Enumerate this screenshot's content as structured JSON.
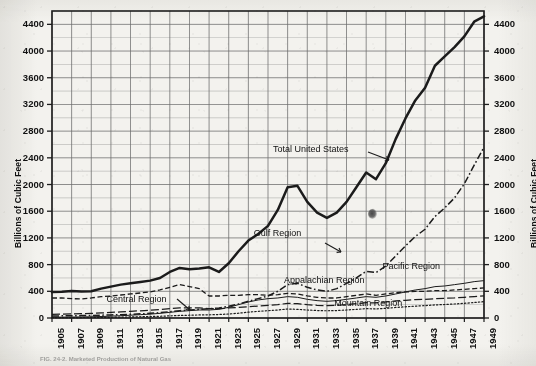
{
  "figure": {
    "caption": "FIG. 24-2.   Marketed Production of Natural Gas",
    "background_color": "#f3f2ee",
    "ink_color": "#1a1a1a"
  },
  "chart_data": {
    "type": "line",
    "title": "",
    "xlabel": "",
    "ylabel": "Billions of Cubic Feet",
    "ylabel_right": "Billions of Cubic Feet",
    "xlim": [
      1905,
      1949
    ],
    "ylim": [
      0,
      4600
    ],
    "yticks": [
      0,
      400,
      800,
      1200,
      1600,
      2000,
      2400,
      2800,
      3200,
      3600,
      4000,
      4400
    ],
    "xticks": [
      1905,
      1907,
      1909,
      1911,
      1913,
      1915,
      1917,
      1919,
      1921,
      1923,
      1925,
      1927,
      1929,
      1931,
      1933,
      1935,
      1937,
      1939,
      1941,
      1943,
      1945,
      1947,
      1949
    ],
    "grid": true,
    "grid_color": "#6d6d6d",
    "legend_position": "inline-annotations",
    "x": [
      1905,
      1906,
      1907,
      1908,
      1909,
      1910,
      1911,
      1912,
      1913,
      1914,
      1915,
      1916,
      1917,
      1918,
      1919,
      1920,
      1921,
      1922,
      1923,
      1924,
      1925,
      1926,
      1927,
      1928,
      1929,
      1930,
      1931,
      1932,
      1933,
      1934,
      1935,
      1936,
      1937,
      1938,
      1939,
      1940,
      1941,
      1942,
      1943,
      1944,
      1945,
      1946,
      1947,
      1948,
      1949
    ],
    "series": [
      {
        "name": "Total United States",
        "style": "solid-heavy",
        "label_x": 1932,
        "label_y": 2520,
        "values": [
          388,
          392,
          405,
          398,
          400,
          440,
          470,
          500,
          520,
          540,
          560,
          600,
          690,
          750,
          730,
          740,
          760,
          690,
          820,
          1000,
          1160,
          1260,
          1380,
          1620,
          1960,
          1980,
          1740,
          1580,
          1500,
          1580,
          1740,
          1960,
          2180,
          2080,
          2320,
          2680,
          2990,
          3260,
          3450,
          3780,
          3920,
          4060,
          4220,
          4440,
          4520
        ]
      },
      {
        "name": "Gulf Region",
        "style": "dash-dot",
        "label_x": 1929,
        "label_y": 1260,
        "values": [
          30,
          32,
          34,
          36,
          38,
          42,
          46,
          50,
          56,
          62,
          70,
          80,
          95,
          110,
          120,
          130,
          140,
          150,
          175,
          210,
          250,
          290,
          330,
          400,
          500,
          520,
          460,
          420,
          400,
          440,
          520,
          600,
          700,
          680,
          780,
          930,
          1080,
          1220,
          1330,
          1520,
          1650,
          1800,
          2010,
          2290,
          2560
        ]
      },
      {
        "name": "Central Region",
        "style": "dashed",
        "label_x": 1913,
        "label_y": 270,
        "values": [
          300,
          300,
          290,
          285,
          300,
          320,
          330,
          345,
          360,
          375,
          390,
          420,
          460,
          500,
          470,
          440,
          330,
          330,
          340,
          340,
          350,
          350,
          340,
          350,
          370,
          360,
          330,
          310,
          300,
          300,
          320,
          340,
          360,
          340,
          360,
          380,
          390,
          400,
          400,
          410,
          410,
          420,
          430,
          440,
          450
        ]
      },
      {
        "name": "Appalachian Region",
        "style": "dash-long",
        "label_x": 1935,
        "label_y": 560,
        "values": [
          55,
          58,
          62,
          66,
          70,
          76,
          84,
          92,
          100,
          108,
          116,
          126,
          140,
          150,
          150,
          150,
          140,
          140,
          150,
          160,
          170,
          180,
          190,
          200,
          220,
          215,
          200,
          190,
          185,
          190,
          200,
          215,
          230,
          225,
          240,
          255,
          265,
          275,
          280,
          290,
          295,
          300,
          310,
          320,
          330
        ]
      },
      {
        "name": "Pacific Region",
        "style": "thin-solid",
        "label_x": 1941,
        "label_y": 760,
        "values": [
          12,
          13,
          14,
          16,
          18,
          22,
          28,
          34,
          42,
          50,
          58,
          70,
          85,
          100,
          110,
          120,
          120,
          130,
          160,
          200,
          240,
          270,
          290,
          300,
          320,
          310,
          280,
          260,
          250,
          260,
          280,
          300,
          320,
          310,
          330,
          360,
          390,
          420,
          440,
          470,
          480,
          500,
          520,
          545,
          560
        ]
      },
      {
        "name": "Mountain Region",
        "style": "dotted",
        "label_x": 1937,
        "label_y": 215,
        "values": [
          4,
          5,
          6,
          7,
          8,
          9,
          11,
          13,
          16,
          19,
          22,
          26,
          32,
          38,
          42,
          46,
          48,
          52,
          60,
          72,
          88,
          100,
          110,
          120,
          135,
          130,
          120,
          112,
          108,
          112,
          120,
          130,
          140,
          136,
          145,
          158,
          168,
          178,
          186,
          196,
          202,
          210,
          220,
          232,
          245
        ]
      }
    ],
    "annotations": [
      {
        "name": "total-us-pointer",
        "text": "Total United States",
        "leader": true
      },
      {
        "name": "gulf-pointer",
        "text": "Gulf Region",
        "leader": true
      },
      {
        "name": "central-pointer",
        "text": "Central Region",
        "leader": true
      },
      {
        "name": "blemish",
        "text": "",
        "note": "scan artifact near 1938 / 1600"
      }
    ]
  }
}
